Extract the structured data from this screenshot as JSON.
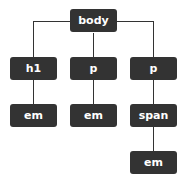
{
  "diagram": {
    "nodes": [
      {
        "id": "body",
        "label": "body"
      },
      {
        "id": "h1",
        "label": "h1",
        "parent": "body"
      },
      {
        "id": "p1",
        "label": "p",
        "parent": "body"
      },
      {
        "id": "p2",
        "label": "p",
        "parent": "body"
      },
      {
        "id": "em1",
        "label": "em",
        "parent": "h1"
      },
      {
        "id": "em2",
        "label": "em",
        "parent": "p1"
      },
      {
        "id": "span",
        "label": "span",
        "parent": "p2"
      },
      {
        "id": "em3",
        "label": "em",
        "parent": "span"
      }
    ],
    "colors": {
      "node_fill": "#333333",
      "node_text": "#ffffff",
      "edge": "#333333"
    }
  }
}
